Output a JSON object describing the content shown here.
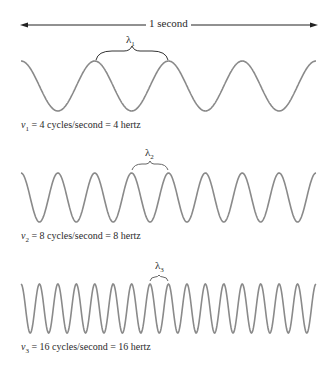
{
  "top_label": "1 second",
  "wave_color": "#8a8a8a",
  "waves": [
    {
      "id": 1,
      "lambda_label": "λ",
      "lambda_sub": "1",
      "caption_nu": "ν",
      "caption_sub": "1",
      "caption_text": " = 4 cycles/second = 4 hertz",
      "cycles": 4
    },
    {
      "id": 2,
      "lambda_label": "λ",
      "lambda_sub": "2",
      "caption_nu": "ν",
      "caption_sub": "2",
      "caption_text": " = 8 cycles/second = 8 hertz",
      "cycles": 8
    },
    {
      "id": 3,
      "lambda_label": "λ",
      "lambda_sub": "3",
      "caption_nu": "ν",
      "caption_sub": "3",
      "caption_text": " = 16 cycles/second = 16 hertz",
      "cycles": 16
    }
  ]
}
